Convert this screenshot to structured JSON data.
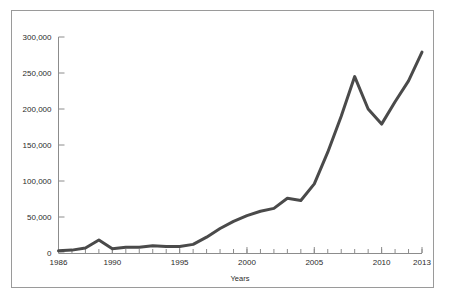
{
  "figure": {
    "background_color": "#ffffff",
    "frame_color": "#9a9a9a",
    "line_color": "#4a4a4a",
    "axis_color": "#8c8c8c",
    "text_color": "#2b2b2b"
  },
  "axes": {
    "x_title": "Years",
    "y_title": "",
    "x_tick_labels": [
      "1986",
      "1990",
      "1995",
      "2000",
      "2005",
      "2010",
      "2013"
    ],
    "y_tick_labels": [
      "0",
      "50,000",
      "100,000",
      "150,000",
      "200,000",
      "250,000",
      "300,000"
    ]
  },
  "chart_data": {
    "type": "line",
    "title": "",
    "xlabel": "Years",
    "ylabel": "",
    "xlim": [
      1986,
      2013
    ],
    "ylim": [
      0,
      300000
    ],
    "xticks": [
      1986,
      1990,
      1995,
      2000,
      2005,
      2010,
      2013
    ],
    "yticks": [
      0,
      50000,
      100000,
      150000,
      200000,
      250000,
      300000
    ],
    "xtick_labels": [
      "1986",
      "1990",
      "1995",
      "2000",
      "2005",
      "2010",
      "2013"
    ],
    "ytick_labels": [
      "0",
      "50,000",
      "100,000",
      "150,000",
      "200,000",
      "250,000",
      "300,000"
    ],
    "grid": false,
    "legend": null,
    "minor_xticks_every": 1,
    "x": [
      1986,
      1987,
      1988,
      1989,
      1990,
      1991,
      1992,
      1993,
      1994,
      1995,
      1996,
      1997,
      1998,
      1999,
      2000,
      2001,
      2002,
      2003,
      2004,
      2005,
      2006,
      2007,
      2008,
      2009,
      2010,
      2011,
      2012,
      2013
    ],
    "values": [
      3000,
      4000,
      7000,
      18000,
      6000,
      8000,
      8000,
      10000,
      9000,
      9000,
      12000,
      22000,
      34000,
      44000,
      52000,
      58000,
      62000,
      76000,
      73000,
      96000,
      140000,
      190000,
      245000,
      200000,
      179000,
      210000,
      239000,
      279000
    ],
    "series": [
      {
        "name": "series-1",
        "color": "#4a4a4a",
        "values": [
          3000,
          4000,
          7000,
          18000,
          6000,
          8000,
          8000,
          10000,
          9000,
          9000,
          12000,
          22000,
          34000,
          44000,
          52000,
          58000,
          62000,
          76000,
          73000,
          96000,
          140000,
          190000,
          245000,
          200000,
          179000,
          210000,
          239000,
          279000
        ]
      }
    ]
  }
}
